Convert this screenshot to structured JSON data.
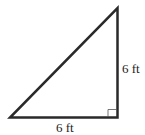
{
  "diagram": {
    "type": "right-triangle",
    "right_angle_vertex": "bottom-right",
    "labels": {
      "vertical_leg": "6 ft",
      "horizontal_leg": "6 ft"
    },
    "stroke_color": "#2a2a2a"
  }
}
